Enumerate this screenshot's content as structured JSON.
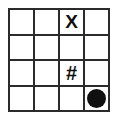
{
  "figure": {
    "background_color": "#ffffff",
    "line_color": "#2b2b2b",
    "mark_color": "#101010",
    "rows": 4,
    "columns": 4
  },
  "grid": {
    "cells": [
      {
        "row": 1,
        "col": 1,
        "type": "empty",
        "label": ""
      },
      {
        "row": 1,
        "col": 2,
        "type": "empty",
        "label": ""
      },
      {
        "row": 1,
        "col": 3,
        "type": "text",
        "label": "X"
      },
      {
        "row": 1,
        "col": 4,
        "type": "empty",
        "label": ""
      },
      {
        "row": 2,
        "col": 1,
        "type": "empty",
        "label": ""
      },
      {
        "row": 2,
        "col": 2,
        "type": "empty",
        "label": ""
      },
      {
        "row": 2,
        "col": 3,
        "type": "empty",
        "label": ""
      },
      {
        "row": 2,
        "col": 4,
        "type": "empty",
        "label": ""
      },
      {
        "row": 3,
        "col": 1,
        "type": "empty",
        "label": ""
      },
      {
        "row": 3,
        "col": 2,
        "type": "empty",
        "label": ""
      },
      {
        "row": 3,
        "col": 3,
        "type": "text",
        "label": "#"
      },
      {
        "row": 3,
        "col": 4,
        "type": "empty",
        "label": ""
      },
      {
        "row": 4,
        "col": 1,
        "type": "empty",
        "label": ""
      },
      {
        "row": 4,
        "col": 2,
        "type": "empty",
        "label": ""
      },
      {
        "row": 4,
        "col": 3,
        "type": "empty",
        "label": ""
      },
      {
        "row": 4,
        "col": 4,
        "type": "disc",
        "label": "filled-circle"
      }
    ]
  }
}
